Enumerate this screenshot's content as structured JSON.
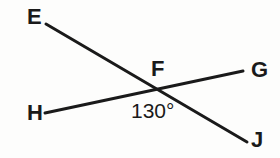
{
  "figure": {
    "background_color": "#fdfdfc",
    "stroke_color": "#1a1a1a",
    "label_color": "#1a1a1a",
    "stroke_width": 3,
    "width": 280,
    "height": 158
  },
  "points": {
    "E": {
      "label": "E",
      "x": 46,
      "y": 24
    },
    "F": {
      "label": "F",
      "x": 158,
      "y": 90
    },
    "G": {
      "label": "G",
      "x": 243,
      "y": 71
    },
    "H": {
      "label": "H",
      "x": 45,
      "y": 113
    },
    "J": {
      "label": "J",
      "x": 247,
      "y": 142
    }
  },
  "segments": [
    {
      "name": "line-EJ",
      "from": "E",
      "to": "J",
      "path": "M 46 24 L 247 142"
    },
    {
      "name": "line-HG",
      "from": "H",
      "to": "G",
      "path": "M 45 113 L 243 71"
    }
  ],
  "angles": [
    {
      "name": "angle-HFJ",
      "value": "130°",
      "measure": 130,
      "unit": "degrees",
      "vertex": "F",
      "rays": [
        "H",
        "J"
      ]
    }
  ]
}
